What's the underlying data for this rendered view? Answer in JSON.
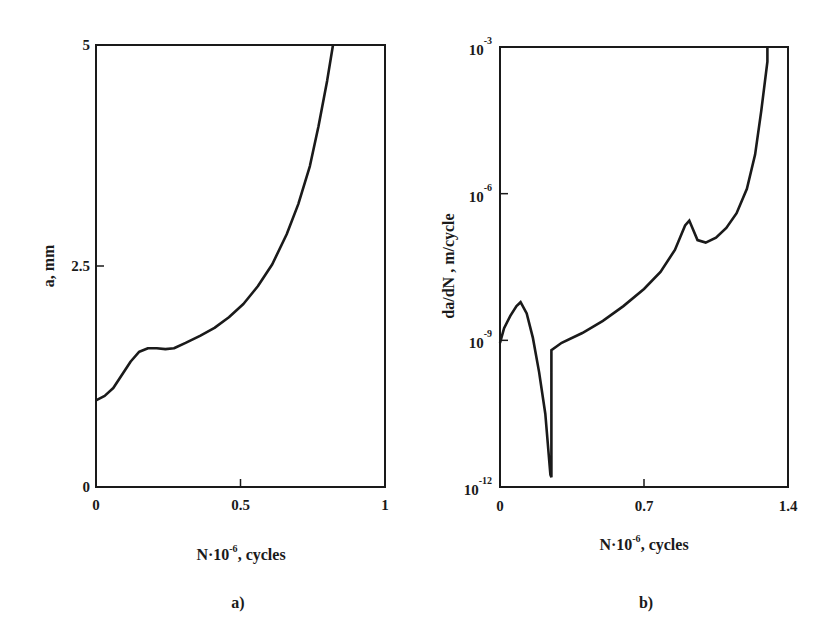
{
  "chart_data": [
    {
      "type": "line",
      "panel_label": "a)",
      "title": "",
      "xlabel": "N·10⁻⁶, cycles",
      "xlabel_parts": {
        "base": "N·10",
        "exp": "-6",
        "suffix": ", cycles"
      },
      "ylabel": "a, mm",
      "xlim": [
        0,
        1
      ],
      "ylim": [
        0,
        5
      ],
      "x_ticks": [
        {
          "value": 0,
          "label": "0"
        },
        {
          "value": 0.5,
          "label": "0.5"
        },
        {
          "value": 1,
          "label": "1"
        }
      ],
      "y_ticks": [
        {
          "value": 0,
          "label": "0"
        },
        {
          "value": 2.5,
          "label": "2.5"
        },
        {
          "value": 5,
          "label": "5"
        }
      ],
      "grid": false,
      "yscale": "linear",
      "series": [
        {
          "name": "crack length",
          "x": [
            0,
            0.03,
            0.06,
            0.09,
            0.12,
            0.15,
            0.18,
            0.21,
            0.24,
            0.27,
            0.31,
            0.36,
            0.41,
            0.46,
            0.51,
            0.56,
            0.61,
            0.66,
            0.7,
            0.74,
            0.77,
            0.8,
            0.82
          ],
          "values": [
            0.98,
            1.03,
            1.12,
            1.27,
            1.42,
            1.53,
            1.57,
            1.57,
            1.56,
            1.57,
            1.63,
            1.71,
            1.8,
            1.92,
            2.07,
            2.27,
            2.52,
            2.86,
            3.2,
            3.63,
            4.08,
            4.6,
            5.0
          ]
        }
      ]
    },
    {
      "type": "line",
      "panel_label": "b)",
      "title": "",
      "xlabel": "N·10⁻⁶, cycles",
      "xlabel_parts": {
        "base": "N·10",
        "exp": "-6",
        "suffix": ", cycles"
      },
      "ylabel": "da/dN , m/cycle",
      "xlim": [
        0,
        1.4
      ],
      "ylim": [
        1e-12,
        0.001
      ],
      "yscale": "log",
      "x_ticks": [
        {
          "value": 0,
          "label": "0"
        },
        {
          "value": 0.7,
          "label": "0.7"
        },
        {
          "value": 1.4,
          "label": "1.4"
        }
      ],
      "y_ticks": [
        {
          "exp": -12,
          "label": "10",
          "sup": "-12"
        },
        {
          "exp": -9,
          "label": "10",
          "sup": "-9"
        },
        {
          "exp": -6,
          "label": "10",
          "sup": "-6"
        },
        {
          "exp": -3,
          "label": "10",
          "sup": "-3"
        }
      ],
      "grid": false,
      "series": [
        {
          "name": "crack growth rate",
          "x": [
            0,
            0.02,
            0.05,
            0.08,
            0.1,
            0.13,
            0.16,
            0.19,
            0.22,
            0.245,
            0.25,
            0.25,
            0.3,
            0.4,
            0.5,
            0.6,
            0.7,
            0.78,
            0.85,
            0.9,
            0.92,
            0.96,
            1.0,
            1.05,
            1.1,
            1.15,
            1.2,
            1.24,
            1.27,
            1.3,
            1.3
          ],
          "log10_values": [
            -9.05,
            -8.75,
            -8.5,
            -8.3,
            -8.22,
            -8.45,
            -8.95,
            -9.65,
            -10.5,
            -11.75,
            -11.8,
            -9.2,
            -9.05,
            -8.85,
            -8.6,
            -8.3,
            -7.95,
            -7.6,
            -7.15,
            -6.65,
            -6.55,
            -6.95,
            -7.0,
            -6.9,
            -6.7,
            -6.4,
            -5.9,
            -5.2,
            -4.3,
            -3.3,
            -3.0
          ]
        }
      ]
    }
  ]
}
